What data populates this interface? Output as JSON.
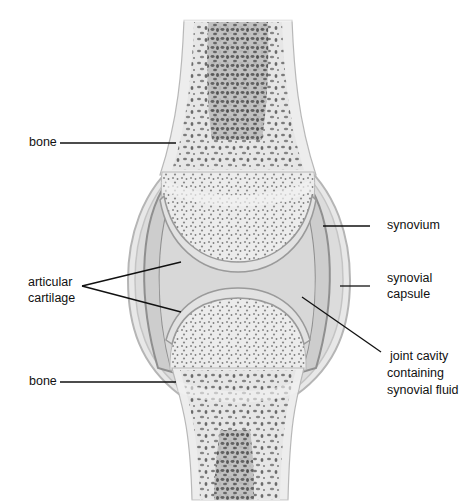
{
  "diagram": {
    "labels": {
      "bone_top": "bone",
      "articular_cartilage_line1": "articular",
      "articular_cartilage_line2": "cartilage",
      "bone_bottom": "bone",
      "synovium": "synovium",
      "synovial_capsule_line1": "synovial",
      "synovial_capsule_line2": "capsule",
      "joint_cavity_line1": "joint cavity",
      "joint_cavity_line2": "containing",
      "joint_cavity_line3": "synovial fluid"
    },
    "colors": {
      "background": "#ffffff",
      "bone_cortex": "#ebebeb",
      "spongy_bone_pores": "#6a6a6a",
      "marrow": "#4a4a4a",
      "cartilage": "#e0e0e0",
      "cavity_fluid": "#d6d6d6",
      "synovium": "#a8a8a8",
      "capsule": "#cfcfcf",
      "leader_line": "#111111"
    }
  }
}
